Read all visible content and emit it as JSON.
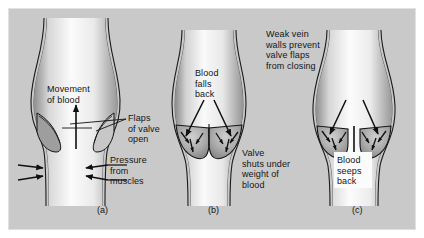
{
  "figure": {
    "background_color": "#c9c9c9",
    "ink_color": "#141414",
    "vein_fill_color": "#f2f2f2",
    "width": 424,
    "height": 238
  },
  "panels": [
    {
      "id": "a",
      "label": "(a)",
      "label_x": 97,
      "label_y": 205,
      "state": "valve open, blood moving up",
      "annotations": [
        {
          "name": "movement-of-blood",
          "text": "Movement\nof blood",
          "x": 47,
          "y": 84,
          "align": "left"
        },
        {
          "name": "flaps-of-valve-open",
          "text": "Flaps\nof valve\nopen",
          "x": 128,
          "y": 113,
          "align": "left"
        },
        {
          "name": "pressure-from-muscles",
          "text": "Pressure\nfrom\nmuscles",
          "x": 110,
          "y": 155,
          "align": "left"
        }
      ]
    },
    {
      "id": "b",
      "label": "(b)",
      "label_x": 208,
      "label_y": 205,
      "state": "valve shut, blood falling back",
      "annotations": [
        {
          "name": "blood-falls-back",
          "text": "Blood\nfalls\nback",
          "x": 195,
          "y": 68,
          "align": "left"
        },
        {
          "name": "valve-shuts-under-weight-of-blood",
          "text": "Valve\nshuts under\nweight of\nblood",
          "x": 242,
          "y": 148,
          "align": "left"
        }
      ]
    },
    {
      "id": "c",
      "label": "(c)",
      "label_x": 352,
      "label_y": 205,
      "state": "weak walls, valve cannot close, blood seeps back",
      "annotations": [
        {
          "name": "weak-vein-walls-prevent-valve-flaps-from-closing",
          "text": "Weak vein\nwalls prevent\nvalve flaps\nfrom closing",
          "x": 266,
          "y": 29,
          "align": "left"
        },
        {
          "name": "blood-seeps-back",
          "text": "Blood\nseeps\nback",
          "x": 337,
          "y": 155,
          "align": "left"
        }
      ]
    }
  ]
}
